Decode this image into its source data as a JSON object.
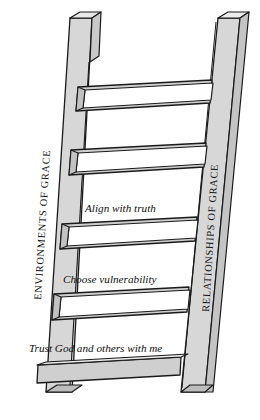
{
  "figure": {
    "name": "ladder-diagram",
    "type": "diagram",
    "orientation": "leaning-ladder"
  },
  "rails": {
    "left": {
      "label": "ENVIRONMENTS OF GRACE",
      "orientation": "vertical-bottom-to-top"
    },
    "right": {
      "label": "RELATIONSHIPS OF GRACE",
      "orientation": "vertical-bottom-to-top"
    }
  },
  "rungs": [
    {
      "index": 1,
      "caption": ""
    },
    {
      "index": 2,
      "caption": "Align with truth"
    },
    {
      "index": 3,
      "caption": "Choose vulnerability"
    },
    {
      "index": 4,
      "caption": "Trust God and others with me"
    }
  ],
  "captions": {
    "rung_2": "Align with truth",
    "rung_3": "Choose vulnerability",
    "rung_4": "Trust God and others with me"
  },
  "colors": {
    "page_background": "#ffffff",
    "rail_face": "#d7d7d7",
    "rail_edge": "#c2c2c2",
    "rung_top": "#ffffff",
    "rung_side": "#cfcfcf",
    "outline": "#1a1a1a",
    "text": "#141414"
  }
}
